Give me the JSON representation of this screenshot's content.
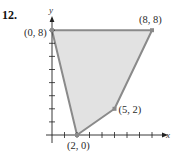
{
  "problem_number": "12.",
  "chart_data": {
    "type": "area",
    "title": "",
    "xlabel": "x",
    "ylabel": "y",
    "xlim": [
      0,
      8.8
    ],
    "ylim": [
      0,
      8.4
    ],
    "grid": false,
    "x_ticks": [
      1,
      2,
      3,
      4,
      5,
      6,
      7,
      8
    ],
    "y_ticks": [
      1,
      2,
      3,
      4,
      5,
      6,
      7,
      8
    ],
    "region": {
      "shape": "polygon",
      "vertices": [
        [
          0,
          8
        ],
        [
          8,
          8
        ],
        [
          5,
          2
        ],
        [
          2,
          0
        ]
      ],
      "fill": "#e2e2e2",
      "edge": "#8a8a8a"
    },
    "points": [
      {
        "x": 0,
        "y": 8,
        "label": "(0, 8)"
      },
      {
        "x": 8,
        "y": 8,
        "label": "(8, 8)"
      },
      {
        "x": 5,
        "y": 2,
        "label": "(5, 2)"
      },
      {
        "x": 2,
        "y": 0,
        "label": "(2, 0)"
      }
    ]
  }
}
